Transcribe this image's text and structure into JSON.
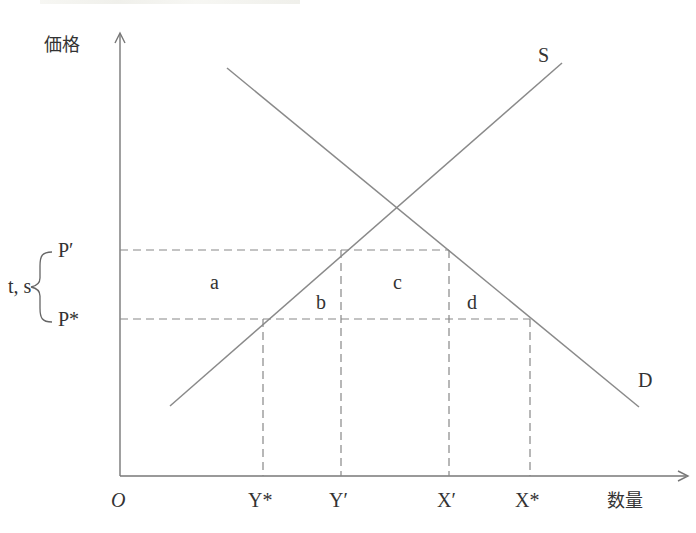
{
  "diagram": {
    "title": "",
    "axes": {
      "y_label": "価格",
      "x_label": "数量",
      "origin_label": "O"
    },
    "curves": [
      {
        "id": "supply",
        "label": "S"
      },
      {
        "id": "demand",
        "label": "D"
      }
    ],
    "price_levels": [
      {
        "id": "p_prime",
        "label": "P′"
      },
      {
        "id": "p_star",
        "label": "P*"
      }
    ],
    "quantity_levels": [
      {
        "id": "y_star",
        "label": "Y*"
      },
      {
        "id": "y_prime",
        "label": "Y′"
      },
      {
        "id": "x_prime",
        "label": "X′"
      },
      {
        "id": "x_star",
        "label": "X*"
      }
    ],
    "bracket_label": "t, s",
    "areas": [
      {
        "id": "a",
        "label": "a"
      },
      {
        "id": "b",
        "label": "b"
      },
      {
        "id": "c",
        "label": "c"
      },
      {
        "id": "d",
        "label": "d"
      }
    ],
    "colors": {
      "line": "#8a8a8a",
      "axis": "#777777",
      "text": "#333333"
    }
  }
}
